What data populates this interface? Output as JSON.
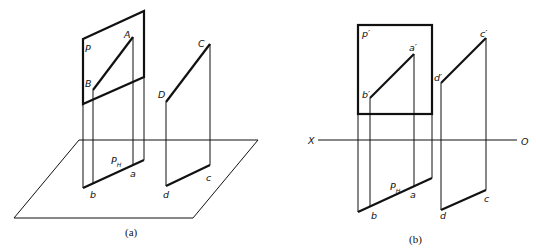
{
  "panel_a": {
    "caption": "(a)",
    "labels": {
      "plane": "P",
      "A": "A",
      "B": "B",
      "C": "C",
      "D": "D",
      "a": "a",
      "b": "b",
      "c": "c",
      "d": "d",
      "trace_main": "P",
      "trace_sub": "H"
    }
  },
  "panel_b": {
    "caption": "(b)",
    "labels": {
      "plane": "p′",
      "a_prime": "a′",
      "b_prime": "b′",
      "c_prime": "c′",
      "d_prime": "d′",
      "a": "a",
      "b": "b",
      "c": "c",
      "d": "d",
      "trace_main": "P",
      "trace_sub": "H",
      "axis_x": "X",
      "axis_o": "O"
    }
  }
}
